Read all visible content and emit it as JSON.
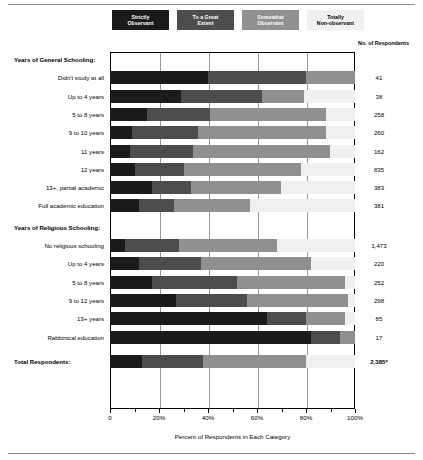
{
  "header": {
    "respondents_header": "No. of Respondents"
  },
  "legend": {
    "items": [
      {
        "label_line1": "Strictly",
        "label_line2": "Observant",
        "color": "#1b1b1b",
        "text_color": "#ffffff"
      },
      {
        "label_line1": "To a Great",
        "label_line2": "Extent",
        "color": "#4d4d4d",
        "text_color": "#ffffff"
      },
      {
        "label_line1": "Somewhat",
        "label_line2": "Observant",
        "color": "#909090",
        "text_color": "#ffffff"
      },
      {
        "label_line1": "Totally",
        "label_line2": "Non-observant",
        "color": "#f0f0f0",
        "text_color": "#000000"
      }
    ]
  },
  "groups": [
    {
      "title": "Years of General Schooling:"
    },
    {
      "title": "Years of Religious Schooling:"
    }
  ],
  "total_label": "Total Respondents:",
  "chart_data": {
    "type": "bar",
    "orientation": "horizontal",
    "stacked": true,
    "title": "",
    "xlabel": "Percent of Respondents in Each Category",
    "ylabel": "",
    "xlim": [
      0,
      100
    ],
    "xticks": [
      0,
      20,
      40,
      60,
      80,
      100
    ],
    "xticklabels": [
      "0",
      "20%",
      "40%",
      "60%",
      "80%",
      "100%"
    ],
    "grid": true,
    "legend_position": "top",
    "series": [
      {
        "name": "Strictly Observant",
        "color": "#1b1b1b"
      },
      {
        "name": "To a Great Extent",
        "color": "#4d4d4d"
      },
      {
        "name": "Somewhat Observant",
        "color": "#909090"
      },
      {
        "name": "Totally Non-observant",
        "color": "#f0f0f0"
      }
    ],
    "sections": [
      {
        "title": "Years of General Schooling:",
        "rows": [
          {
            "category": "Didn't study at all",
            "values": [
              40,
              40,
              20,
              0
            ],
            "count": "41"
          },
          {
            "category": "Up to 4 years",
            "values": [
              29,
              33,
              17,
              21
            ],
            "count": "38"
          },
          {
            "category": "5 to 8 years",
            "values": [
              15,
              26,
              47,
              12
            ],
            "count": "258"
          },
          {
            "category": "9 to 10 years",
            "values": [
              9,
              27,
              52,
              12
            ],
            "count": "260"
          },
          {
            "category": "11 years",
            "values": [
              8,
              26,
              56,
              10
            ],
            "count": "162"
          },
          {
            "category": "12 years",
            "values": [
              10,
              20,
              48,
              22
            ],
            "count": "835"
          },
          {
            "category": "13+, partial academic",
            "values": [
              17,
              16,
              37,
              30
            ],
            "count": "383"
          },
          {
            "category": "Full academic education",
            "values": [
              12,
              14,
              31,
              43
            ],
            "count": "381"
          }
        ]
      },
      {
        "title": "Years of Religious Schooling:",
        "rows": [
          {
            "category": "No religious schooling",
            "values": [
              6,
              22,
              40,
              32
            ],
            "count": "1,473"
          },
          {
            "category": "Up to 4 years",
            "values": [
              12,
              25,
              45,
              18
            ],
            "count": "220"
          },
          {
            "category": "5 to 8 years",
            "values": [
              17,
              35,
              44,
              4
            ],
            "count": "252"
          },
          {
            "category": "9 to 12 years",
            "values": [
              27,
              29,
              41,
              3
            ],
            "count": "298"
          },
          {
            "category": "13+ years",
            "values": [
              64,
              16,
              16,
              4
            ],
            "count": "85"
          },
          {
            "category": "Rabbinical education",
            "values": [
              82,
              12,
              6,
              0
            ],
            "count": "17"
          }
        ]
      }
    ],
    "total_row": {
      "category": "Total Respondents:",
      "values": [
        13,
        25,
        42,
        20
      ],
      "count": "2,385*"
    }
  }
}
